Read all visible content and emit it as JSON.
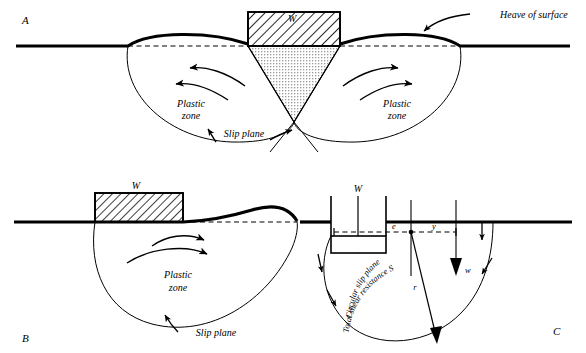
{
  "figure": {
    "type": "geotechnical-bearing-capacity-failure-diagram",
    "panels": [
      {
        "id": "A",
        "letter": "A",
        "description": "General shear failure beneath a strip footing with symmetric plastic zones and surface heave on both sides",
        "labels": {
          "load_block": "W",
          "heave": "Heave of surface",
          "plastic_zone_left": [
            "Plastic",
            "zone"
          ],
          "plastic_zone_right": [
            "Plastic",
            "zone"
          ],
          "slip_plane": "Slip plane"
        }
      },
      {
        "id": "B",
        "letter": "B",
        "description": "Local / one-sided shear failure beneath an edge footing with a single plastic zone and heave to one side",
        "labels": {
          "load_block": "W",
          "plastic_zone": [
            "Plastic",
            "zone"
          ],
          "slip_plane": "Slip plane"
        }
      },
      {
        "id": "C",
        "letter": "C",
        "description": "Circular slip (rotational) failure analysis of a footing showing load W, eccentricity e, moment arm y, radius r, soil weight w and total shear resistance S along the arc",
        "labels": {
          "load": "W",
          "eccentricity": "e",
          "arm": "y",
          "radius": "r",
          "soil_weight": "w",
          "arc_upper": "Circular slip plane",
          "arc_lower": "Total shear resistance S"
        }
      }
    ],
    "colors": {
      "ink": "#000000",
      "background": "#ffffff",
      "wedge_fill": "#d8d8d8",
      "hatch": "#000000"
    }
  }
}
